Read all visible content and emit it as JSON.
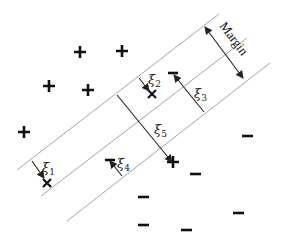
{
  "diagram": {
    "type": "svm-soft-margin",
    "margin_label": "Margin",
    "slack_labels": [
      {
        "sym": "ξ",
        "sub": "1"
      },
      {
        "sym": "ξ",
        "sub": "2"
      },
      {
        "sym": "ξ",
        "sub": "3"
      },
      {
        "sym": "ξ",
        "sub": "4"
      },
      {
        "sym": "ξ",
        "sub": "5"
      }
    ],
    "lines": [
      {
        "name": "upper-margin-line",
        "x1": 17,
        "y1": 170,
        "x2": 219,
        "y2": 14
      },
      {
        "name": "decision-boundary",
        "x1": 41,
        "y1": 196,
        "x2": 247,
        "y2": 38
      },
      {
        "name": "lower-margin-line",
        "x1": 67,
        "y1": 221,
        "x2": 270,
        "y2": 63
      }
    ],
    "positive_points": [
      [
        80,
        52
      ],
      [
        122,
        51
      ],
      [
        49,
        86
      ],
      [
        88,
        90
      ],
      [
        24,
        132
      ],
      [
        173,
        162
      ]
    ],
    "negative_points": [
      [
        247,
        136
      ],
      [
        195,
        174
      ],
      [
        144,
        197
      ],
      [
        238,
        213
      ],
      [
        144,
        225
      ],
      [
        187,
        230
      ]
    ],
    "misclassified_positive_marks": [
      [
        47,
        183
      ],
      [
        152,
        94
      ]
    ],
    "misclassified_negative_marks": [
      [
        172,
        73
      ],
      [
        110,
        160
      ]
    ],
    "colors": {
      "line": "#9a9a9a",
      "arrow": "#222222",
      "marker": "#111111"
    }
  }
}
